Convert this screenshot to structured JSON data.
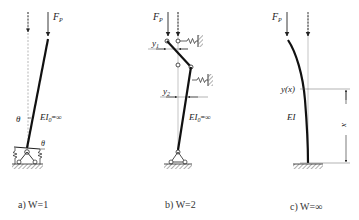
{
  "figures": [
    {
      "id": "a",
      "caption": "a) W=1",
      "load_label": "F",
      "load_sub": "P",
      "angle_label": "θ",
      "angle_label_base": "θ",
      "stiffness_label": "EI",
      "stiffness_sub": "0",
      "stiffness_suffix": "=∞"
    },
    {
      "id": "b",
      "caption": "b) W=2",
      "load_label": "F",
      "load_sub": "P",
      "disp1_label": "y",
      "disp1_sub": "1",
      "disp2_label": "y",
      "disp2_sub": "2",
      "stiffness_label": "EI",
      "stiffness_sub": "0",
      "stiffness_suffix": "=∞"
    },
    {
      "id": "c",
      "caption": "c) W=∞",
      "load_label": "F",
      "load_sub": "P",
      "deflection_label": "y(x)",
      "stiffness_label": "EI",
      "coord_label": "x"
    }
  ],
  "colors": {
    "ink": "#222222",
    "hatch": "#888888",
    "thin": "#666666"
  }
}
